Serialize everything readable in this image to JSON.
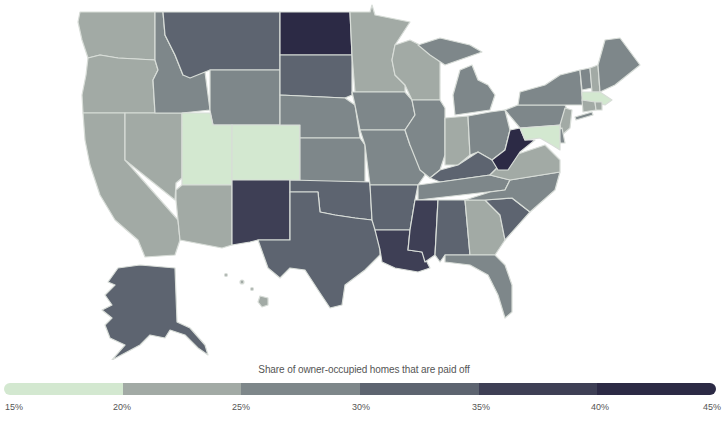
{
  "legend": {
    "title": "Share of owner-occupied homes that are paid off",
    "ticks": [
      "15%",
      "20%",
      "25%",
      "30%",
      "35%",
      "40%",
      "45%"
    ],
    "segments": [
      {
        "range": "15-20%",
        "color": "#d3e8d0"
      },
      {
        "range": "20-25%",
        "color": "#a2aaa5"
      },
      {
        "range": "25-30%",
        "color": "#7e878a"
      },
      {
        "range": "30-35%",
        "color": "#5d6470"
      },
      {
        "range": "35-40%",
        "color": "#3e3f55"
      },
      {
        "range": "40-45%",
        "color": "#2c2a45"
      }
    ]
  },
  "map": {
    "title": "Share of owner-occupied homes that are paid off by state",
    "states": {
      "WA": {
        "bin": "20-25%",
        "color": "#a2aaa5"
      },
      "OR": {
        "bin": "20-25%",
        "color": "#a2aaa5"
      },
      "CA": {
        "bin": "20-25%",
        "color": "#a2aaa5"
      },
      "NV": {
        "bin": "20-25%",
        "color": "#a2aaa5"
      },
      "ID": {
        "bin": "25-30%",
        "color": "#7e878a"
      },
      "MT": {
        "bin": "30-35%",
        "color": "#5d6470"
      },
      "WY": {
        "bin": "25-30%",
        "color": "#7e878a"
      },
      "UT": {
        "bin": "15-20%",
        "color": "#d3e8d0"
      },
      "CO": {
        "bin": "15-20%",
        "color": "#d3e8d0"
      },
      "AZ": {
        "bin": "20-25%",
        "color": "#a2aaa5"
      },
      "NM": {
        "bin": "35-40%",
        "color": "#3e3f55"
      },
      "ND": {
        "bin": "40-45%",
        "color": "#2c2a45"
      },
      "SD": {
        "bin": "30-35%",
        "color": "#5d6470"
      },
      "NE": {
        "bin": "25-30%",
        "color": "#7e878a"
      },
      "KS": {
        "bin": "25-30%",
        "color": "#7e878a"
      },
      "OK": {
        "bin": "30-35%",
        "color": "#5d6470"
      },
      "TX": {
        "bin": "30-35%",
        "color": "#5d6470"
      },
      "MN": {
        "bin": "20-25%",
        "color": "#a2aaa5"
      },
      "IA": {
        "bin": "25-30%",
        "color": "#7e878a"
      },
      "MO": {
        "bin": "25-30%",
        "color": "#7e878a"
      },
      "AR": {
        "bin": "30-35%",
        "color": "#5d6470"
      },
      "LA": {
        "bin": "35-40%",
        "color": "#3e3f55"
      },
      "WI": {
        "bin": "20-25%",
        "color": "#a2aaa5"
      },
      "IL": {
        "bin": "25-30%",
        "color": "#7e878a"
      },
      "MI": {
        "bin": "25-30%",
        "color": "#7e878a"
      },
      "IN": {
        "bin": "20-25%",
        "color": "#a2aaa5"
      },
      "OH": {
        "bin": "25-30%",
        "color": "#7e878a"
      },
      "KY": {
        "bin": "30-35%",
        "color": "#5d6470"
      },
      "TN": {
        "bin": "25-30%",
        "color": "#7e878a"
      },
      "MS": {
        "bin": "35-40%",
        "color": "#3e3f55"
      },
      "AL": {
        "bin": "30-35%",
        "color": "#5d6470"
      },
      "GA": {
        "bin": "20-25%",
        "color": "#a2aaa5"
      },
      "FL": {
        "bin": "25-30%",
        "color": "#7e878a"
      },
      "SC": {
        "bin": "30-35%",
        "color": "#5d6470"
      },
      "NC": {
        "bin": "25-30%",
        "color": "#7e878a"
      },
      "VA": {
        "bin": "20-25%",
        "color": "#a2aaa5"
      },
      "WV": {
        "bin": "40-45%",
        "color": "#2c2a45"
      },
      "PA": {
        "bin": "25-30%",
        "color": "#7e878a"
      },
      "NY": {
        "bin": "25-30%",
        "color": "#7e878a"
      },
      "VT": {
        "bin": "25-30%",
        "color": "#7e878a"
      },
      "NH": {
        "bin": "20-25%",
        "color": "#a2aaa5"
      },
      "ME": {
        "bin": "25-30%",
        "color": "#7e878a"
      },
      "MA": {
        "bin": "15-20%",
        "color": "#d3e8d0"
      },
      "CT": {
        "bin": "20-25%",
        "color": "#a2aaa5"
      },
      "RI": {
        "bin": "20-25%",
        "color": "#a2aaa5"
      },
      "NJ": {
        "bin": "20-25%",
        "color": "#a2aaa5"
      },
      "DE": {
        "bin": "25-30%",
        "color": "#7e878a"
      },
      "MD": {
        "bin": "15-20%",
        "color": "#d3e8d0"
      },
      "AK": {
        "bin": "30-35%",
        "color": "#5d6470"
      },
      "HI": {
        "bin": "20-25%",
        "color": "#a2aaa5"
      }
    }
  }
}
